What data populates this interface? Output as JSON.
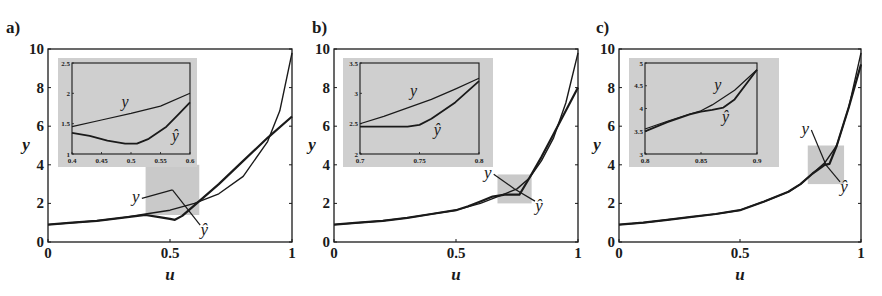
{
  "figure": {
    "background": "#ffffff",
    "ink_color": "#1a1a1a",
    "highlight_color": "#c9c9c9",
    "inset_bg_color": "#cfcfcf"
  },
  "chart_data": [
    {
      "type": "line",
      "panel": "a)",
      "xlabel": "u",
      "ylabel": "y",
      "xlim": [
        0,
        1
      ],
      "ylim": [
        0,
        10
      ],
      "xticks": [
        "0",
        "0.5",
        "1"
      ],
      "yticks": [
        "0",
        "2",
        "4",
        "6",
        "8",
        "10"
      ],
      "grid": false,
      "series": [
        {
          "name": "y",
          "x": [
            0,
            0.1,
            0.2,
            0.3,
            0.4,
            0.5,
            0.6,
            0.7,
            0.8,
            0.9,
            0.95,
            1.0
          ],
          "values": [
            0.9,
            1.0,
            1.1,
            1.25,
            1.45,
            1.65,
            2.0,
            2.5,
            3.4,
            5.2,
            6.8,
            9.8
          ]
        },
        {
          "name": "ŷ",
          "x": [
            0,
            0.1,
            0.2,
            0.3,
            0.4,
            0.45,
            0.5,
            0.52,
            0.55,
            0.6,
            0.7,
            0.8,
            0.9,
            1.0
          ],
          "values": [
            0.9,
            1.0,
            1.1,
            1.25,
            1.4,
            1.3,
            1.2,
            1.15,
            1.35,
            1.9,
            3.0,
            4.2,
            5.4,
            6.5
          ]
        }
      ],
      "highlight_box": {
        "x": [
          0.4,
          0.62
        ],
        "y": [
          1.4,
          4.0
        ]
      },
      "annotations": [
        {
          "text": "y",
          "u": 0.36,
          "y": 2.05
        },
        {
          "text": "ŷ",
          "u": 0.64,
          "y": 0.35
        }
      ],
      "inset": {
        "xlim": [
          0.4,
          0.6
        ],
        "ylim": [
          1,
          2.5
        ],
        "xticks": [
          "0.4",
          "0.45",
          "0.5",
          "0.55",
          "0.6"
        ],
        "yticks": [
          "1",
          "1.5",
          "2",
          "2.5"
        ],
        "series": [
          {
            "name": "y",
            "x": [
              0.4,
              0.45,
              0.5,
              0.55,
              0.6
            ],
            "values": [
              1.45,
              1.56,
              1.67,
              1.79,
              2.0
            ]
          },
          {
            "name": "ŷ",
            "x": [
              0.4,
              0.43,
              0.46,
              0.49,
              0.51,
              0.53,
              0.56,
              0.58,
              0.6
            ],
            "values": [
              1.35,
              1.3,
              1.22,
              1.17,
              1.17,
              1.25,
              1.45,
              1.65,
              1.85
            ]
          }
        ],
        "annotations": [
          {
            "text": "y",
            "u": 0.49,
            "y": 1.78
          },
          {
            "text": "ŷ",
            "u": 0.575,
            "y": 1.22
          }
        ]
      }
    },
    {
      "type": "line",
      "panel": "b)",
      "xlabel": "u",
      "ylabel": "y",
      "xlim": [
        0,
        1
      ],
      "ylim": [
        0,
        10
      ],
      "xticks": [
        "0",
        "0.5",
        "1"
      ],
      "yticks": [
        "0",
        "2",
        "4",
        "6",
        "8",
        "10"
      ],
      "grid": false,
      "series": [
        {
          "name": "y",
          "x": [
            0,
            0.1,
            0.2,
            0.3,
            0.4,
            0.5,
            0.6,
            0.7,
            0.75,
            0.8,
            0.85,
            0.9,
            0.95,
            1.0
          ],
          "values": [
            0.9,
            1.0,
            1.1,
            1.25,
            1.45,
            1.65,
            2.0,
            2.5,
            2.75,
            3.3,
            4.2,
            5.4,
            7.2,
            9.8
          ]
        },
        {
          "name": "ŷ",
          "x": [
            0,
            0.1,
            0.2,
            0.3,
            0.4,
            0.5,
            0.55,
            0.6,
            0.65,
            0.7,
            0.76,
            0.8,
            0.85,
            0.9,
            0.95,
            1.0
          ],
          "values": [
            0.9,
            1.0,
            1.1,
            1.25,
            1.45,
            1.65,
            1.85,
            2.1,
            2.35,
            2.45,
            2.45,
            3.3,
            4.4,
            5.6,
            6.8,
            8.0
          ]
        }
      ],
      "highlight_box": {
        "x": [
          0.67,
          0.81
        ],
        "y": [
          2.0,
          3.5
        ]
      },
      "annotations": [
        {
          "text": "y",
          "u": 0.63,
          "y": 3.3
        },
        {
          "text": "ŷ",
          "u": 0.84,
          "y": 1.6
        }
      ],
      "inset": {
        "xlim": [
          0.7,
          0.8
        ],
        "ylim": [
          2,
          3.5
        ],
        "xticks": [
          "0.7",
          "0.75",
          "0.8"
        ],
        "yticks": [
          "2",
          "2.5",
          "3",
          "3.5"
        ],
        "series": [
          {
            "name": "y",
            "x": [
              0.7,
              0.72,
              0.74,
              0.76,
              0.78,
              0.8
            ],
            "values": [
              2.5,
              2.62,
              2.76,
              2.9,
              3.07,
              3.25
            ]
          },
          {
            "name": "ŷ",
            "x": [
              0.7,
              0.72,
              0.74,
              0.75,
              0.76,
              0.78,
              0.8
            ],
            "values": [
              2.45,
              2.45,
              2.45,
              2.48,
              2.58,
              2.85,
              3.2
            ]
          }
        ],
        "annotations": [
          {
            "text": "y",
            "u": 0.745,
            "y": 2.95
          },
          {
            "text": "ŷ",
            "u": 0.765,
            "y": 2.32
          }
        ]
      }
    },
    {
      "type": "line",
      "panel": "c)",
      "xlabel": "u",
      "ylabel": "y",
      "xlim": [
        0,
        1
      ],
      "ylim": [
        0,
        10
      ],
      "xticks": [
        "0",
        "0.5",
        "1"
      ],
      "yticks": [
        "0",
        "2",
        "4",
        "6",
        "8",
        "10"
      ],
      "grid": false,
      "series": [
        {
          "name": "y",
          "x": [
            0,
            0.1,
            0.2,
            0.3,
            0.4,
            0.5,
            0.6,
            0.7,
            0.75,
            0.8,
            0.85,
            0.9,
            0.95,
            1.0
          ],
          "values": [
            0.9,
            1.0,
            1.15,
            1.3,
            1.45,
            1.65,
            2.1,
            2.6,
            3.0,
            3.55,
            4.1,
            5.0,
            7.0,
            9.8
          ]
        },
        {
          "name": "ŷ",
          "x": [
            0,
            0.1,
            0.2,
            0.3,
            0.4,
            0.5,
            0.6,
            0.7,
            0.75,
            0.8,
            0.85,
            0.87,
            0.9,
            0.95,
            1.0
          ],
          "values": [
            0.9,
            1.0,
            1.15,
            1.3,
            1.45,
            1.65,
            2.1,
            2.6,
            3.0,
            3.55,
            4.0,
            4.05,
            5.0,
            7.0,
            9.2
          ]
        }
      ],
      "highlight_box": {
        "x": [
          0.78,
          0.93
        ],
        "y": [
          3.0,
          5.0
        ]
      },
      "annotations": [
        {
          "text": "y",
          "u": 0.77,
          "y": 5.6
        },
        {
          "text": "ŷ",
          "u": 0.93,
          "y": 2.6
        }
      ],
      "inset": {
        "xlim": [
          0.8,
          0.9
        ],
        "ylim": [
          3,
          5
        ],
        "xticks": [
          "0.8",
          "0.85",
          "0.9"
        ],
        "yticks": [
          "3",
          "3.5",
          "4",
          "4.5",
          "5"
        ],
        "series": [
          {
            "name": "y",
            "x": [
              0.8,
              0.82,
              0.84,
              0.85,
              0.86,
              0.88,
              0.9
            ],
            "values": [
              3.55,
              3.72,
              3.88,
              3.95,
              4.08,
              4.4,
              4.85
            ]
          },
          {
            "name": "ŷ",
            "x": [
              0.8,
              0.82,
              0.84,
              0.85,
              0.86,
              0.87,
              0.88,
              0.9
            ],
            "values": [
              3.5,
              3.7,
              3.87,
              3.93,
              3.97,
              4.02,
              4.2,
              4.85
            ]
          }
        ],
        "annotations": [
          {
            "text": "y",
            "u": 0.865,
            "y": 4.4
          },
          {
            "text": "ŷ",
            "u": 0.872,
            "y": 3.7
          }
        ]
      }
    }
  ]
}
